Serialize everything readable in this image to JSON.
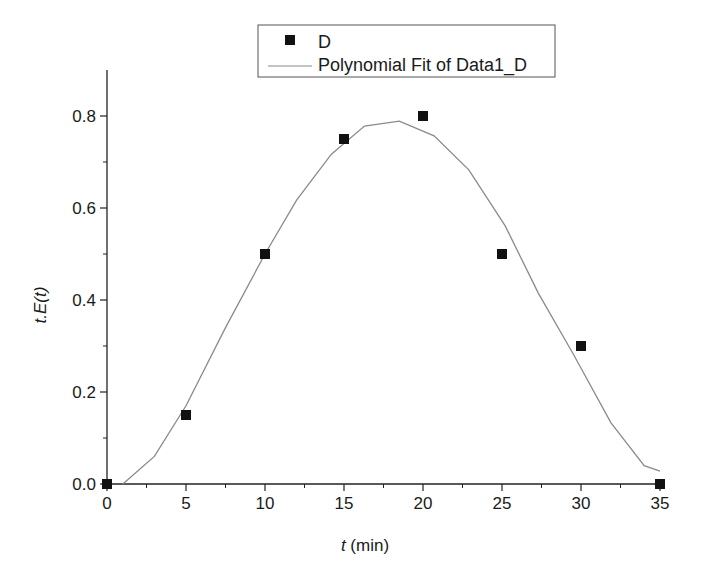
{
  "chart_data": {
    "type": "scatter",
    "title": "",
    "xlabel": "t (min)",
    "xlabel_italic_part": "t",
    "xlabel_rest": " (min)",
    "ylabel": "t.E(t)",
    "xlim": [
      0,
      35
    ],
    "ylim": [
      0,
      0.9
    ],
    "x_ticks": [
      0,
      5,
      10,
      15,
      20,
      25,
      30,
      35
    ],
    "x_tick_labels": [
      "0",
      "5",
      "10",
      "15",
      "20",
      "25",
      "30",
      "35"
    ],
    "y_ticks": [
      0.0,
      0.2,
      0.4,
      0.6,
      0.8
    ],
    "y_tick_labels": [
      "0.0",
      "0.2",
      "0.4",
      "0.6",
      "0.8"
    ],
    "grid": false,
    "legend_position": "top-center",
    "series": [
      {
        "name": "D",
        "kind": "scatter",
        "marker": "square",
        "color": "#111111",
        "x": [
          0,
          5,
          10,
          15,
          20,
          25,
          30,
          35
        ],
        "y": [
          0.0,
          0.15,
          0.5,
          0.75,
          0.8,
          0.5,
          0.3,
          0.0
        ]
      },
      {
        "name": "Polynomial Fit of Data1_D",
        "kind": "line",
        "color": "#8a8a8a",
        "x": [
          1.0,
          3.0,
          5.0,
          7.5,
          10.0,
          12.0,
          14.2,
          16.3,
          18.5,
          20.7,
          22.9,
          25.2,
          27.3,
          29.5,
          31.9,
          34.0,
          35.0
        ],
        "y": [
          0.0,
          0.06,
          0.17,
          0.34,
          0.5,
          0.617,
          0.717,
          0.778,
          0.789,
          0.757,
          0.683,
          0.561,
          0.415,
          0.283,
          0.133,
          0.04,
          0.028
        ]
      }
    ]
  }
}
